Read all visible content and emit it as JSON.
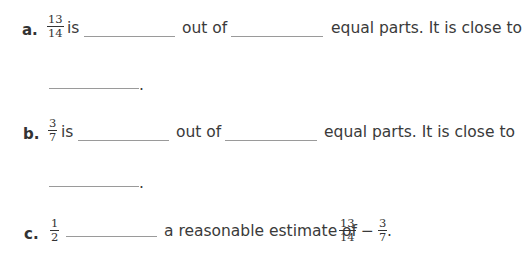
{
  "items": [
    {
      "label": "a.",
      "fraction": {
        "num": "13",
        "den": "14"
      },
      "text_is": "is",
      "text_out_of": "out of",
      "text_tail": "equal parts. It is close to",
      "period": "."
    },
    {
      "label": "b.",
      "fraction": {
        "num": "3",
        "den": "7"
      },
      "text_is": "is",
      "text_out_of": "out of",
      "text_tail": "equal parts. It is close to",
      "period": "."
    },
    {
      "label": "c.",
      "fraction": {
        "num": "1",
        "den": "2"
      },
      "text_mid": "a reasonable estimate of",
      "expr": {
        "a": {
          "num": "13",
          "den": "14"
        },
        "op": "−",
        "b": {
          "num": "3",
          "den": "7"
        }
      },
      "period": "."
    }
  ],
  "colors": {
    "text": "#3a3a3a",
    "blank_line": "#9a9a9a"
  }
}
